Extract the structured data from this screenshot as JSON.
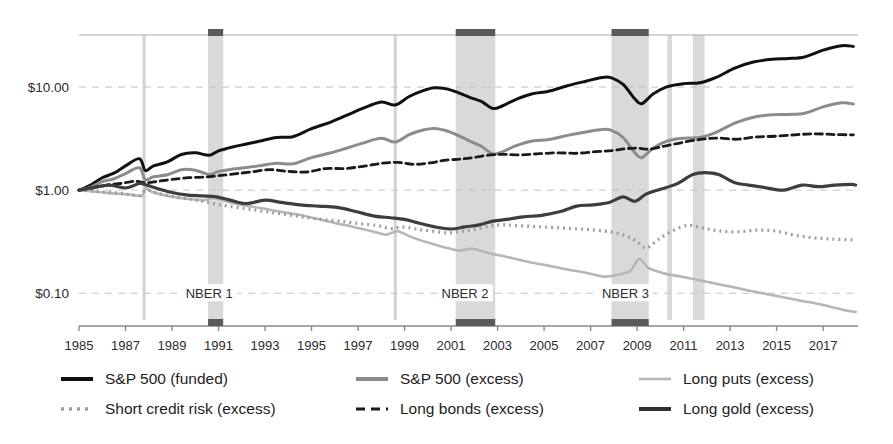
{
  "chart_data": {
    "type": "line",
    "title": "",
    "xlabel": "",
    "ylabel": "",
    "yscale": "log",
    "ylim": [
      0.055,
      32
    ],
    "xlim": [
      1985.0,
      2018.5
    ],
    "grid": "horizontal-dashed",
    "legend_position": "below-3-columns",
    "ytick_labels": [
      "$10.00",
      "$1.00",
      "$0.10"
    ],
    "ytick_values": [
      10,
      1,
      0.1
    ],
    "xtick_labels": [
      "1985",
      "1987",
      "1989",
      "1991",
      "1993",
      "1995",
      "1997",
      "1999",
      "2001",
      "2003",
      "2005",
      "2007",
      "2009",
      "2011",
      "2013",
      "2015",
      "2017"
    ],
    "xtick_values": [
      1985,
      1987,
      1989,
      1991,
      1993,
      1995,
      1997,
      1999,
      2001,
      2003,
      2005,
      2007,
      2009,
      2011,
      2013,
      2015,
      2017
    ],
    "annotations": [
      {
        "text": "NBER 1",
        "x": 1990.6,
        "y": 0.1
      },
      {
        "text": "NBER 2",
        "x": 2001.6,
        "y": 0.1
      },
      {
        "text": "NBER 3",
        "x": 2008.5,
        "y": 0.1
      }
    ],
    "recession_bands": [
      {
        "name": "NBER 1",
        "x0": 1990.55,
        "x1": 1991.2,
        "capped": true
      },
      {
        "name": "NBER 2",
        "x0": 2001.2,
        "x1": 2002.9,
        "capped": true
      },
      {
        "name": "NBER 3",
        "x0": 2007.9,
        "x1": 2009.5,
        "capped": true
      },
      {
        "name": "band-2010",
        "x0": 2010.3,
        "x1": 2010.5,
        "capped": false
      },
      {
        "name": "band-2011",
        "x0": 2011.4,
        "x1": 2011.9,
        "capped": false
      }
    ],
    "event_lines": [
      {
        "name": "1987-crash",
        "x": 1987.8
      },
      {
        "name": "1998-event",
        "x": 1998.6
      }
    ],
    "series": [
      {
        "name": "S&P 500 (funded)",
        "color": "#111111",
        "style": "solid",
        "width": 3.0,
        "x": [
          1985.0,
          1985.5,
          1986.0,
          1986.5,
          1987.0,
          1987.6,
          1987.85,
          1988.2,
          1988.8,
          1989.4,
          1990.0,
          1990.6,
          1991.0,
          1991.6,
          1992.2,
          1992.8,
          1993.5,
          1994.2,
          1995.0,
          1995.8,
          1996.5,
          1997.2,
          1998.0,
          1998.6,
          1999.2,
          1999.8,
          2000.3,
          2000.8,
          2001.3,
          2001.8,
          2002.3,
          2002.8,
          2003.2,
          2003.8,
          2004.5,
          2005.2,
          2006.0,
          2006.8,
          2007.5,
          2007.9,
          2008.4,
          2008.9,
          2009.2,
          2009.7,
          2010.3,
          2011.0,
          2011.7,
          2012.4,
          2013.2,
          2014.0,
          2014.8,
          2015.5,
          2016.2,
          2017.0,
          2017.8,
          2018.3
        ],
        "y": [
          1.0,
          1.12,
          1.32,
          1.46,
          1.72,
          2.02,
          1.55,
          1.72,
          1.88,
          2.22,
          2.3,
          2.18,
          2.4,
          2.62,
          2.8,
          3.0,
          3.25,
          3.3,
          3.95,
          4.55,
          5.3,
          6.2,
          7.15,
          6.7,
          8.1,
          9.25,
          9.85,
          9.6,
          8.85,
          7.95,
          7.25,
          6.2,
          6.55,
          7.6,
          8.6,
          9.1,
          10.3,
          11.4,
          12.4,
          12.3,
          10.6,
          7.7,
          6.9,
          8.6,
          10.1,
          10.8,
          11.0,
          12.4,
          15.3,
          17.5,
          18.6,
          18.9,
          19.6,
          22.8,
          25.2,
          24.8
        ]
      },
      {
        "name": "S&P 500 (excess)",
        "color": "#8c8c8c",
        "style": "solid",
        "width": 3.0,
        "x": [
          1985.0,
          1985.5,
          1986.0,
          1986.5,
          1987.0,
          1987.6,
          1987.85,
          1988.2,
          1988.8,
          1989.4,
          1990.0,
          1990.6,
          1991.0,
          1991.6,
          1992.2,
          1992.8,
          1993.5,
          1994.2,
          1995.0,
          1995.8,
          1996.5,
          1997.2,
          1998.0,
          1998.6,
          1999.2,
          1999.8,
          2000.3,
          2000.8,
          2001.3,
          2001.8,
          2002.3,
          2002.8,
          2003.2,
          2003.8,
          2004.5,
          2005.2,
          2006.0,
          2006.8,
          2007.5,
          2007.9,
          2008.4,
          2008.9,
          2009.2,
          2009.7,
          2010.3,
          2011.0,
          2011.7,
          2012.4,
          2013.2,
          2014.0,
          2014.8,
          2015.5,
          2016.2,
          2017.0,
          2017.8,
          2018.3
        ],
        "y": [
          1.0,
          1.07,
          1.21,
          1.29,
          1.45,
          1.65,
          1.26,
          1.35,
          1.41,
          1.58,
          1.56,
          1.42,
          1.52,
          1.6,
          1.66,
          1.73,
          1.82,
          1.8,
          2.07,
          2.29,
          2.55,
          2.86,
          3.18,
          2.93,
          3.45,
          3.83,
          3.96,
          3.77,
          3.4,
          2.99,
          2.67,
          2.24,
          2.35,
          2.7,
          3.0,
          3.1,
          3.4,
          3.67,
          3.88,
          3.8,
          3.24,
          2.32,
          2.07,
          2.57,
          3.0,
          3.19,
          3.24,
          3.64,
          4.47,
          5.09,
          5.38,
          5.43,
          5.58,
          6.43,
          7.05,
          6.85
        ]
      },
      {
        "name": "Long puts (excess)",
        "color": "#b6b6b6",
        "style": "solid",
        "width": 2.6,
        "x": [
          1985.0,
          1985.6,
          1986.2,
          1986.8,
          1987.3,
          1987.7,
          1987.85,
          1988.1,
          1988.6,
          1989.2,
          1989.8,
          1990.4,
          1990.8,
          1991.3,
          1992.0,
          1992.8,
          1993.6,
          1994.4,
          1995.2,
          1996.0,
          1996.8,
          1997.6,
          1998.2,
          1998.7,
          1999.3,
          2000.0,
          2000.7,
          2001.3,
          2001.9,
          2002.5,
          2003.0,
          2003.6,
          2004.4,
          2005.2,
          2006.0,
          2006.8,
          2007.6,
          2008.1,
          2008.7,
          2009.1,
          2009.5,
          2010.2,
          2010.9,
          2011.6,
          2012.3,
          2013.1,
          2014.0,
          2015.0,
          2016.0,
          2017.0,
          2018.0,
          2018.4
        ],
        "y": [
          1.0,
          0.97,
          0.94,
          0.92,
          0.9,
          0.88,
          1.05,
          0.97,
          0.9,
          0.85,
          0.82,
          0.8,
          0.84,
          0.78,
          0.72,
          0.67,
          0.62,
          0.58,
          0.53,
          0.48,
          0.44,
          0.4,
          0.37,
          0.4,
          0.35,
          0.31,
          0.28,
          0.26,
          0.27,
          0.25,
          0.235,
          0.22,
          0.2,
          0.185,
          0.17,
          0.158,
          0.145,
          0.15,
          0.165,
          0.215,
          0.175,
          0.155,
          0.145,
          0.135,
          0.125,
          0.115,
          0.104,
          0.094,
          0.085,
          0.077,
          0.068,
          0.066
        ]
      },
      {
        "name": "Short credit risk (excess)",
        "color": "#9e9e9e",
        "style": "dotted",
        "width": 3.2,
        "x": [
          1985.0,
          1985.6,
          1986.3,
          1987.0,
          1987.6,
          1987.9,
          1988.4,
          1989.0,
          1989.7,
          1990.3,
          1990.8,
          1991.4,
          1992.2,
          1993.0,
          1993.8,
          1994.6,
          1995.4,
          1996.2,
          1997.0,
          1997.8,
          1998.4,
          1998.9,
          1999.5,
          2000.2,
          2000.9,
          2001.5,
          2002.0,
          2002.6,
          2003.1,
          2003.7,
          2004.5,
          2005.3,
          2006.1,
          2006.9,
          2007.6,
          2008.1,
          2008.6,
          2009.0,
          2009.4,
          2009.9,
          2010.5,
          2011.2,
          2011.9,
          2012.6,
          2013.4,
          2014.2,
          2015.0,
          2015.8,
          2016.6,
          2017.4,
          2018.2,
          2018.4
        ],
        "y": [
          1.0,
          0.98,
          0.95,
          0.92,
          0.89,
          1.0,
          0.93,
          0.87,
          0.82,
          0.78,
          0.74,
          0.7,
          0.66,
          0.62,
          0.585,
          0.55,
          0.52,
          0.5,
          0.475,
          0.455,
          0.425,
          0.44,
          0.42,
          0.4,
          0.385,
          0.4,
          0.415,
          0.445,
          0.46,
          0.455,
          0.445,
          0.435,
          0.425,
          0.415,
          0.4,
          0.385,
          0.355,
          0.315,
          0.275,
          0.33,
          0.4,
          0.455,
          0.425,
          0.4,
          0.395,
          0.41,
          0.4,
          0.365,
          0.345,
          0.335,
          0.33,
          0.325
        ]
      },
      {
        "name": "Long bonds (excess)",
        "color": "#1a1a1a",
        "style": "dashed",
        "width": 2.8,
        "x": [
          1985.0,
          1985.6,
          1986.2,
          1986.8,
          1987.4,
          1987.9,
          1988.4,
          1989.0,
          1989.7,
          1990.4,
          1991.0,
          1991.7,
          1992.4,
          1993.2,
          1994.0,
          1994.8,
          1995.6,
          1996.4,
          1997.2,
          1998.0,
          1998.7,
          1999.4,
          2000.1,
          2000.8,
          2001.4,
          2002.0,
          2002.7,
          2003.3,
          2004.0,
          2004.8,
          2005.6,
          2006.4,
          2007.2,
          2007.9,
          2008.5,
          2009.0,
          2009.5,
          2010.2,
          2011.0,
          2011.8,
          2012.5,
          2013.3,
          2014.1,
          2015.0,
          2015.9,
          2016.7,
          2017.5,
          2018.3
        ],
        "y": [
          1.0,
          1.05,
          1.12,
          1.16,
          1.22,
          1.18,
          1.22,
          1.27,
          1.32,
          1.34,
          1.38,
          1.44,
          1.5,
          1.58,
          1.52,
          1.5,
          1.62,
          1.62,
          1.7,
          1.82,
          1.86,
          1.78,
          1.84,
          1.96,
          2.0,
          2.08,
          2.2,
          2.22,
          2.2,
          2.26,
          2.3,
          2.28,
          2.36,
          2.42,
          2.52,
          2.56,
          2.5,
          2.68,
          2.92,
          3.12,
          3.2,
          3.12,
          3.28,
          3.34,
          3.46,
          3.52,
          3.46,
          3.44
        ]
      },
      {
        "name": "Long gold (excess)",
        "color": "#3d3d3d",
        "style": "solid",
        "width": 3.2,
        "x": [
          1985.0,
          1985.6,
          1986.3,
          1987.0,
          1987.6,
          1987.9,
          1988.3,
          1988.9,
          1989.6,
          1990.3,
          1990.9,
          1991.5,
          1992.2,
          1993.0,
          1993.7,
          1994.5,
          1995.3,
          1996.1,
          1996.9,
          1997.7,
          1998.4,
          1999.0,
          1999.6,
          2000.3,
          2001.0,
          2001.6,
          2002.2,
          2002.8,
          2003.4,
          2004.1,
          2004.9,
          2005.7,
          2006.4,
          2007.1,
          2007.8,
          2008.4,
          2008.9,
          2009.4,
          2010.0,
          2010.7,
          2011.4,
          2011.9,
          2012.5,
          2013.2,
          2013.8,
          2014.5,
          2015.3,
          2016.1,
          2016.8,
          2017.5,
          2018.2,
          2018.4
        ],
        "y": [
          1.0,
          1.06,
          1.12,
          1.05,
          1.16,
          1.12,
          1.05,
          0.96,
          0.9,
          0.88,
          0.86,
          0.8,
          0.74,
          0.8,
          0.76,
          0.72,
          0.7,
          0.68,
          0.62,
          0.56,
          0.54,
          0.52,
          0.48,
          0.44,
          0.42,
          0.44,
          0.46,
          0.5,
          0.52,
          0.55,
          0.57,
          0.62,
          0.7,
          0.72,
          0.76,
          0.86,
          0.78,
          0.92,
          1.02,
          1.15,
          1.42,
          1.48,
          1.42,
          1.18,
          1.12,
          1.06,
          1.0,
          1.12,
          1.08,
          1.12,
          1.14,
          1.12
        ]
      }
    ]
  },
  "legend": {
    "items": [
      {
        "label": "S&P 500 (funded)",
        "key": "sp500-funded",
        "color": "#111111",
        "style": "solid",
        "width": 4.0
      },
      {
        "label": "S&P 500 (excess)",
        "key": "sp500-excess",
        "color": "#8c8c8c",
        "style": "solid",
        "width": 4.0
      },
      {
        "label": "Long puts (excess)",
        "key": "long-puts-excess",
        "color": "#b6b6b6",
        "style": "solid",
        "width": 2.6
      },
      {
        "label": "Short credit risk (excess)",
        "key": "short-credit-risk-excess",
        "color": "#9e9e9e",
        "style": "dotted",
        "width": 3.4
      },
      {
        "label": "Long bonds (excess)",
        "key": "long-bonds-excess",
        "color": "#1a1a1a",
        "style": "dashed",
        "width": 3.0
      },
      {
        "label": "Long gold (excess)",
        "key": "long-gold-excess",
        "color": "#2f2f2f",
        "style": "solid",
        "width": 4.0
      }
    ]
  },
  "colors": {
    "gridline": "#b9c6d2",
    "band_fill": "#d9d9d9",
    "band_cap": "#5a5a5a",
    "event_line": "#d2d2d2",
    "axis": "#8a8a8a",
    "text": "#1d1d1d"
  }
}
